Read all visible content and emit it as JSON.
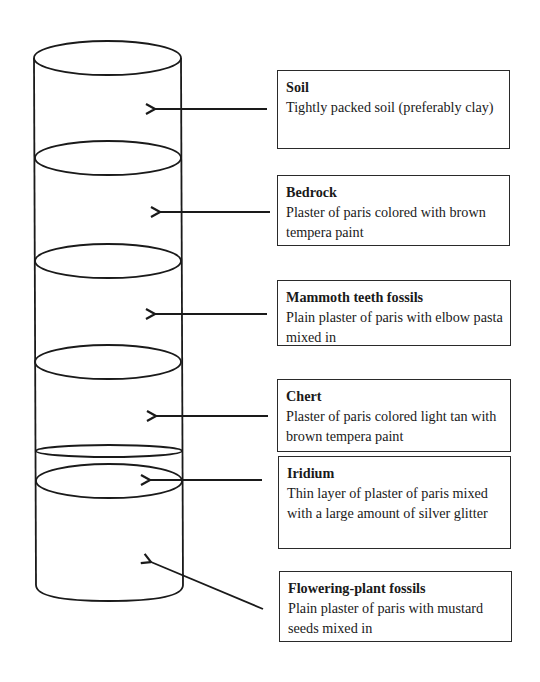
{
  "diagram": {
    "type": "layered-cylinder",
    "colors": {
      "stroke": "#1a1a1a",
      "background": "#ffffff"
    },
    "layers": [
      {
        "title": "Soil",
        "description": "Tightly packed soil (preferably clay)"
      },
      {
        "title": "Bedrock",
        "description": "Plaster of paris colored with brown tempera paint"
      },
      {
        "title": "Mammoth teeth fossils",
        "description": "Plain plaster of paris with elbow pasta mixed in"
      },
      {
        "title": "Chert",
        "description": "Plaster of paris colored light tan with brown tempera paint"
      },
      {
        "title": "Iridium",
        "description": "Thin layer of plaster of paris mixed with a large amount of silver glitter"
      },
      {
        "title": "Flowering-plant fossils",
        "description": "Plain plaster of paris with mustard seeds mixed in"
      }
    ]
  }
}
